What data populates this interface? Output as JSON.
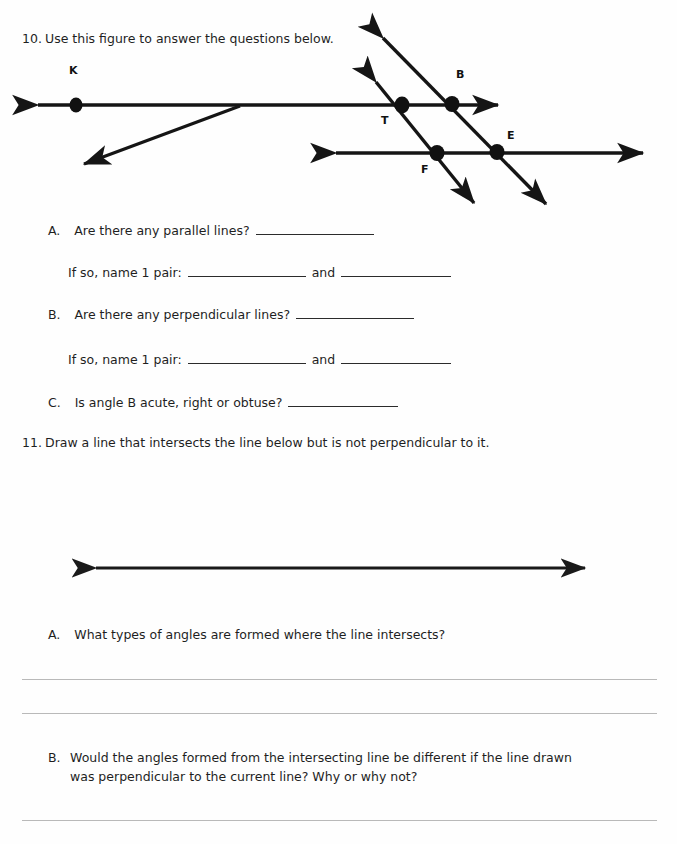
{
  "document": {
    "kind": "geometry-worksheet",
    "ink_color": "#1a1a1a",
    "rule_color": "#b9b9b9",
    "paper_color": "#fefefe"
  },
  "question10": {
    "number": "10.",
    "prompt": "Use this figure to answer the questions below.",
    "figure": {
      "name": "parallel-lines-transversals-figure",
      "point_labels": [
        "K",
        "B",
        "T",
        "E",
        "F"
      ],
      "points": [
        {
          "label": "K",
          "x": 76,
          "y": 105
        },
        {
          "label": "T",
          "x": 402,
          "y": 105
        },
        {
          "label": "B",
          "x": 452,
          "y": 104
        },
        {
          "label": "F",
          "x": 437,
          "y": 153
        },
        {
          "label": "E",
          "x": 497,
          "y": 152
        }
      ],
      "lines": [
        {
          "name": "upper-horizontal-line",
          "x1": 30,
          "y1": 105,
          "x2": 505,
          "y2": 105,
          "arrows": "both"
        },
        {
          "name": "lower-horizontal-line",
          "x1": 328,
          "y1": 153,
          "x2": 650,
          "y2": 153,
          "arrows": "both"
        },
        {
          "name": "slanted-ray-from-upper-line",
          "x1": 238,
          "y1": 105,
          "x2": 79,
          "y2": 166,
          "arrows": "end"
        },
        {
          "name": "left-transversal",
          "x1": 371,
          "y1": 76,
          "x2": 478,
          "y2": 208,
          "arrows": "both"
        },
        {
          "name": "right-transversal",
          "x1": 378,
          "y1": 32,
          "x2": 551,
          "y2": 209,
          "arrows": "both"
        }
      ]
    },
    "parts": [
      {
        "letter": "A.",
        "text": "Are there any parallel lines?",
        "blank_px": 118,
        "follow_up": {
          "text": "If so, name 1 pair:",
          "blank1_px": 118,
          "conjunction": "and",
          "blank2_px": 110
        }
      },
      {
        "letter": "B.",
        "text": "Are there any perpendicular lines?",
        "blank_px": 118,
        "follow_up": {
          "text": "If so, name 1 pair:",
          "blank1_px": 118,
          "conjunction": "and",
          "blank2_px": 110
        }
      },
      {
        "letter": "C.",
        "text": "Is angle B acute, right or obtuse?",
        "blank_px": 110
      }
    ]
  },
  "question11": {
    "number": "11.",
    "prompt": "Draw a line that intersects the line below but is not perpendicular to it.",
    "figure": {
      "name": "single-horizontal-line-figure",
      "lines": [
        {
          "name": "work-line",
          "x1": 88,
          "y1": 568,
          "x2": 592,
          "y2": 568,
          "arrows": "both"
        }
      ]
    },
    "parts": [
      {
        "letter": "A.",
        "text": "What types of angles are formed where the line intersects?",
        "answer_rules": 2
      },
      {
        "letter": "B.",
        "line1": "Would the angles formed from the intersecting line be different if the line drawn",
        "line2": "was perpendicular to the current line? Why or why not?",
        "answer_rules": 1
      }
    ]
  },
  "answer_rules": [
    {
      "name": "answer-rule-1",
      "x": 22,
      "y": 679,
      "width": 635
    },
    {
      "name": "answer-rule-2",
      "x": 22,
      "y": 713,
      "width": 635
    },
    {
      "name": "answer-rule-3",
      "x": 22,
      "y": 820,
      "width": 635
    }
  ]
}
